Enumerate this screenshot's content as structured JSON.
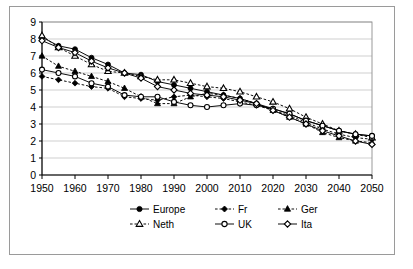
{
  "chart_data": {
    "type": "line",
    "title": "",
    "xlabel": "",
    "ylabel": "",
    "xlim": [
      1950,
      2050
    ],
    "ylim": [
      0,
      9
    ],
    "grid": true,
    "legend_position": "bottom",
    "x": [
      1950,
      1955,
      1960,
      1965,
      1970,
      1975,
      1980,
      1985,
      1990,
      1995,
      2000,
      2005,
      2010,
      2015,
      2020,
      2025,
      2030,
      2035,
      2040,
      2045,
      2050
    ],
    "xtick_labels": [
      "1950",
      "1960",
      "1970",
      "1980",
      "1990",
      "2000",
      "2010",
      "2020",
      "2030",
      "2040",
      "2050"
    ],
    "xticks": [
      1950,
      1960,
      1970,
      1980,
      1990,
      2000,
      2010,
      2020,
      2030,
      2040,
      2050
    ],
    "ytick_labels": [
      "0",
      "1",
      "2",
      "3",
      "4",
      "5",
      "6",
      "7",
      "8",
      "9"
    ],
    "yticks": [
      0,
      1,
      2,
      3,
      4,
      5,
      6,
      7,
      8,
      9
    ],
    "series": [
      {
        "name": "Europe",
        "marker": "filled-circle",
        "line": "solid",
        "values": [
          8.1,
          7.6,
          7.4,
          6.9,
          6.5,
          6.0,
          5.9,
          5.5,
          5.3,
          5.1,
          4.9,
          4.7,
          4.5,
          4.2,
          3.9,
          3.6,
          3.2,
          2.9,
          2.6,
          2.4,
          2.3
        ]
      },
      {
        "name": "Fr",
        "marker": "filled-diamond",
        "line": "dashed",
        "values": [
          5.8,
          5.6,
          5.4,
          5.2,
          5.1,
          4.6,
          4.5,
          4.4,
          4.6,
          4.7,
          4.6,
          4.5,
          4.3,
          4.1,
          3.8,
          3.5,
          3.1,
          2.7,
          2.4,
          2.2,
          2.1
        ]
      },
      {
        "name": "Ger",
        "marker": "filled-triangle",
        "line": "dashed",
        "values": [
          7.0,
          6.4,
          6.1,
          5.8,
          5.5,
          5.1,
          4.6,
          4.2,
          4.2,
          4.6,
          4.8,
          4.7,
          4.5,
          4.2,
          3.8,
          3.4,
          3.0,
          2.5,
          2.2,
          2.0,
          1.9
        ]
      },
      {
        "name": "Neth",
        "marker": "open-triangle",
        "line": "dashed",
        "values": [
          8.2,
          7.5,
          7.0,
          6.5,
          6.1,
          6.0,
          5.8,
          5.6,
          5.6,
          5.4,
          5.2,
          5.1,
          4.9,
          4.6,
          4.3,
          3.9,
          3.4,
          3.0,
          2.6,
          2.4,
          2.2
        ]
      },
      {
        "name": "UK",
        "marker": "open-circle",
        "line": "solid",
        "values": [
          6.2,
          6.0,
          5.8,
          5.4,
          5.2,
          4.7,
          4.6,
          4.6,
          4.3,
          4.1,
          4.0,
          4.1,
          4.2,
          4.1,
          3.9,
          3.6,
          3.2,
          2.9,
          2.6,
          2.4,
          2.3
        ]
      },
      {
        "name": "Ita",
        "marker": "open-diamond",
        "line": "solid",
        "values": [
          7.9,
          7.5,
          7.2,
          6.7,
          6.3,
          6.0,
          5.7,
          5.2,
          5.0,
          4.8,
          4.7,
          4.6,
          4.4,
          4.2,
          3.8,
          3.4,
          3.0,
          2.6,
          2.3,
          2.0,
          1.8
        ]
      }
    ]
  },
  "legend": {
    "entries": [
      {
        "label": "Europe"
      },
      {
        "label": "Fr"
      },
      {
        "label": "Ger"
      },
      {
        "label": "Neth"
      },
      {
        "label": "UK"
      },
      {
        "label": "Ita"
      }
    ]
  },
  "colors": {
    "series": "#000000",
    "grid": "#c9c9c9",
    "axis": "#000000",
    "background": "#ffffff",
    "frame": "#9a9a9a"
  }
}
